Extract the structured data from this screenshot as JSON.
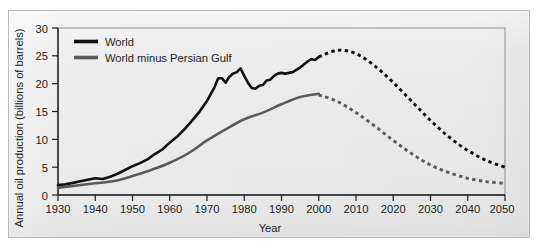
{
  "chart_data": {
    "type": "line",
    "title": "",
    "xlabel": "Year",
    "ylabel": "Annual oil production (billions of barrels)",
    "xlim": [
      1930,
      2050
    ],
    "ylim": [
      0,
      30
    ],
    "grid": false,
    "legend_position": "top-left",
    "xticks": [
      "1930",
      "1940",
      "1950",
      "1960",
      "1970",
      "1980",
      "1990",
      "2000",
      "2010",
      "2020",
      "2030",
      "2040",
      "2050"
    ],
    "yticks": [
      "0",
      "5",
      "10",
      "15",
      "20",
      "25",
      "30"
    ],
    "annotations": [
      "Solid segments are historical data through ~2000; dotted segments are projections to 2050."
    ],
    "series": [
      {
        "name": "World",
        "color": "#111111",
        "style_historical": "solid",
        "style_projected": "dotted",
        "x": [
          1930,
          1932,
          1934,
          1936,
          1938,
          1940,
          1942,
          1944,
          1946,
          1948,
          1950,
          1952,
          1954,
          1956,
          1958,
          1960,
          1962,
          1964,
          1966,
          1968,
          1970,
          1971,
          1972,
          1973,
          1974,
          1975,
          1976,
          1977,
          1978,
          1979,
          1980,
          1981,
          1982,
          1983,
          1984,
          1985,
          1986,
          1987,
          1988,
          1989,
          1990,
          1991,
          1992,
          1993,
          1994,
          1995,
          1996,
          1997,
          1998,
          1999,
          2000
        ],
        "values": [
          1.3,
          1.4,
          1.6,
          1.8,
          2.0,
          2.2,
          2.1,
          2.4,
          2.8,
          3.3,
          3.8,
          4.2,
          4.7,
          5.4,
          6.0,
          6.9,
          7.7,
          8.7,
          9.8,
          11.0,
          12.4,
          13.3,
          14.2,
          15.4,
          15.4,
          14.8,
          15.6,
          16.0,
          16.2,
          16.7,
          15.7,
          14.8,
          14.1,
          14.0,
          14.4,
          14.5,
          15.1,
          15.2,
          15.7,
          16.0,
          16.1,
          16.0,
          16.1,
          16.2,
          16.5,
          16.8,
          17.2,
          17.6,
          17.9,
          17.8,
          18.2
        ],
        "peak_note": "World production peak of about 26 billion barrels around 2005"
      },
      {
        "name": "World minus Persian Gulf",
        "color": "#5a5a5a",
        "style_historical": "solid",
        "style_projected": "dotted",
        "x": [
          1930,
          1935,
          1940,
          1945,
          1950,
          1955,
          1960,
          1965,
          1970,
          1975,
          1980,
          1985,
          1990,
          1995,
          2000
        ],
        "values": [
          1.3,
          1.7,
          2.1,
          2.5,
          3.4,
          4.5,
          5.8,
          7.5,
          9.8,
          11.8,
          13.6,
          14.8,
          16.3,
          17.6,
          18.2
        ],
        "peak_note": "Non-Persian-Gulf production peaks near 18 billion barrels around 1998"
      }
    ],
    "projection_points": {
      "world": [
        {
          "year": 2000,
          "value": 24.8
        },
        {
          "year": 2005,
          "value": 26.0
        },
        {
          "year": 2010,
          "value": 25.4
        },
        {
          "year": 2015,
          "value": 23.2
        },
        {
          "year": 2020,
          "value": 20.2
        },
        {
          "year": 2025,
          "value": 16.8
        },
        {
          "year": 2030,
          "value": 13.4
        },
        {
          "year": 2035,
          "value": 10.4
        },
        {
          "year": 2040,
          "value": 8.0
        },
        {
          "year": 2045,
          "value": 6.2
        },
        {
          "year": 2050,
          "value": 5.0
        }
      ],
      "world_minus_gulf": [
        {
          "year": 2000,
          "value": 18.0
        },
        {
          "year": 2005,
          "value": 16.8
        },
        {
          "year": 2010,
          "value": 14.8
        },
        {
          "year": 2015,
          "value": 12.4
        },
        {
          "year": 2020,
          "value": 9.8
        },
        {
          "year": 2025,
          "value": 7.4
        },
        {
          "year": 2030,
          "value": 5.4
        },
        {
          "year": 2035,
          "value": 4.0
        },
        {
          "year": 2040,
          "value": 3.0
        },
        {
          "year": 2045,
          "value": 2.4
        },
        {
          "year": 2050,
          "value": 2.1
        }
      ]
    }
  },
  "legend": {
    "items": [
      {
        "label": "World",
        "color": "#111111"
      },
      {
        "label": "World minus Persian Gulf",
        "color": "#5a5a5a"
      }
    ]
  },
  "axes": {
    "x_title": "Year",
    "y_title": "Annual oil production (billions of barrels)",
    "x_ticks": [
      "1930",
      "1940",
      "1950",
      "1960",
      "1970",
      "1980",
      "1990",
      "2000",
      "2010",
      "2020",
      "2030",
      "2040",
      "2050"
    ],
    "y_ticks": [
      "30",
      "25",
      "20",
      "15",
      "10",
      "5",
      "0"
    ]
  }
}
